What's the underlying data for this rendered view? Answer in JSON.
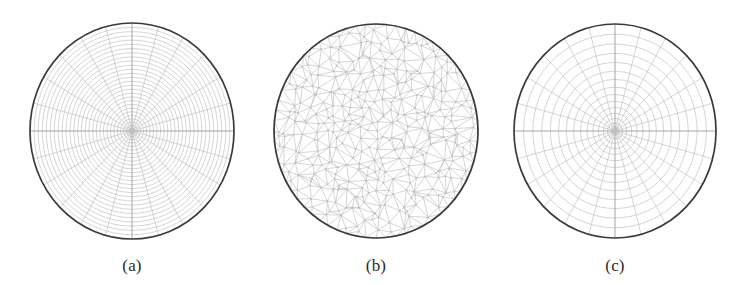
{
  "figure": {
    "background_color": "#ffffff",
    "width": 749,
    "height": 285,
    "mesh_line_color": "#b8b8b8",
    "boundary_color": "#3a3a3a",
    "caption_color": "#2b2b2b"
  },
  "panels": [
    {
      "id": "panel-a",
      "caption": "(a)",
      "mesh_type": "structured-polar",
      "center_x": 132,
      "center_y": 131,
      "radius_x": 102,
      "radius_y": 108,
      "rings": 28,
      "spokes": 24,
      "ring_distribution": "near-uniform-slightly-denser-at-rim",
      "caption_x": 132,
      "caption_y": 256
    },
    {
      "id": "panel-b",
      "caption": "(b)",
      "mesh_type": "unstructured-triangular",
      "center_x": 376,
      "center_y": 131,
      "radius_x": 102,
      "radius_y": 107,
      "node_spacing": 10,
      "interior_rings": 11,
      "caption_x": 376,
      "caption_y": 256
    },
    {
      "id": "panel-c",
      "caption": "(c)",
      "mesh_type": "structured-polar",
      "center_x": 615,
      "center_y": 131,
      "radius_x": 101,
      "radius_y": 107,
      "rings": 16,
      "spokes": 24,
      "ring_distribution": "denser-at-rim",
      "caption_x": 615,
      "caption_y": 256
    }
  ],
  "chart_data": {
    "type": "diagram",
    "title": "",
    "subtitle": "",
    "series": [
      {
        "name": "(a)",
        "kind": "polar grid",
        "rings": 28,
        "spokes": 24
      },
      {
        "name": "(b)",
        "kind": "triangular Delaunay grid",
        "rings": 11,
        "spokes": 0
      },
      {
        "name": "(c)",
        "kind": "polar grid",
        "rings": 16,
        "spokes": 24
      }
    ],
    "categories": [
      "(a)",
      "(b)",
      "(c)"
    ],
    "values": [
      28,
      11,
      16
    ],
    "xlabel": "",
    "ylabel": "",
    "legend_position": "none",
    "grid": false
  }
}
